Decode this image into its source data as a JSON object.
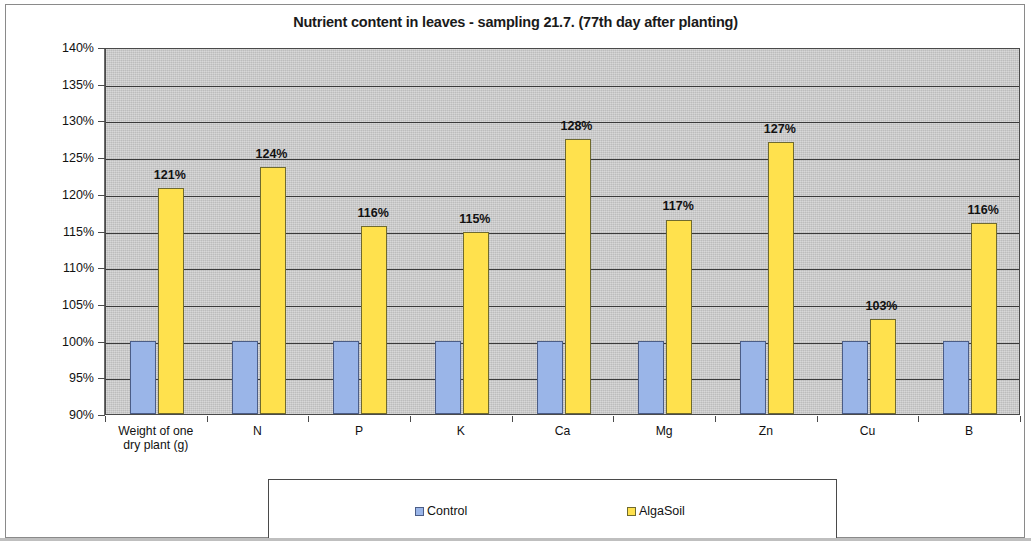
{
  "chart_data": {
    "type": "bar",
    "title": "Nutrient content in leaves - sampling 21.7. (77th day after planting)",
    "xlabel": "",
    "ylabel": "",
    "ylim": [
      90,
      140
    ],
    "ytick_step": 5,
    "grid": true,
    "legend_position": "bottom",
    "ytick_labels": [
      "140%",
      "135%",
      "130%",
      "125%",
      "120%",
      "115%",
      "110%",
      "105%",
      "100%",
      "95%",
      "90%"
    ],
    "ytick_values": [
      140,
      135,
      130,
      125,
      120,
      115,
      110,
      105,
      100,
      95,
      90
    ],
    "categories": [
      "Weight of one\ndry plant (g)",
      "N",
      "P",
      "K",
      "Ca",
      "Mg",
      "Zn",
      "Cu",
      "B"
    ],
    "category_labels": [
      [
        "Weight of one",
        "dry plant (g)"
      ],
      [
        "N"
      ],
      [
        "P"
      ],
      [
        "K"
      ],
      [
        "Ca"
      ],
      [
        "Mg"
      ],
      [
        "Zn"
      ],
      [
        "Cu"
      ],
      [
        "B"
      ]
    ],
    "series": [
      {
        "name": "Control",
        "color": "#9ab5e8",
        "values": [
          100,
          100,
          100,
          100,
          100,
          100,
          100,
          100,
          100
        ],
        "data_labels": [
          "",
          "",
          "",
          "",
          "",
          "",
          "",
          "",
          ""
        ]
      },
      {
        "name": "AlgaSoil",
        "color": "#ffe14d",
        "values": [
          120.8,
          123.7,
          115.6,
          114.8,
          127.5,
          116.5,
          127.0,
          103.0,
          116.0
        ],
        "data_labels": [
          "121%",
          "124%",
          "116%",
          "115%",
          "128%",
          "117%",
          "127%",
          "103%",
          "116%"
        ]
      }
    ]
  },
  "legend": {
    "items": [
      {
        "label": "Control",
        "swatch": "control-swatch"
      },
      {
        "label": "AlgaSoil",
        "swatch": "algasoil-swatch"
      }
    ]
  }
}
